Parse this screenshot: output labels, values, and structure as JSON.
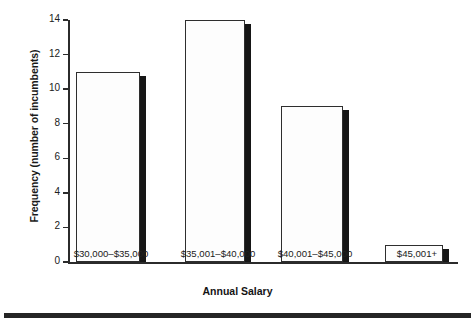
{
  "chart_data": {
    "type": "bar",
    "title": "",
    "subtitle": "",
    "xlabel": "Annual Salary",
    "ylabel": "Frequency (number of incumbents)",
    "categories": [
      "$30,000–$35,000",
      "$35,001–$40,000",
      "$40,001–$45,000",
      "$45,001+"
    ],
    "values": [
      11,
      14,
      9,
      1
    ],
    "series": [
      {
        "name": "Frequency",
        "values": [
          11,
          14,
          9,
          1
        ]
      }
    ],
    "ylim": [
      0,
      14
    ],
    "yticks": [
      0,
      2,
      4,
      6,
      8,
      10,
      12,
      14
    ],
    "ytick_labels": [
      "0",
      "2",
      "4",
      "6",
      "8",
      "10",
      "12",
      "14"
    ],
    "grid": false,
    "legend": false,
    "legend_position": "none",
    "bar_fill_color": "#fdfdfd",
    "bar_edge_color": "#2e2e2e",
    "bar_shadow_color": "#161616",
    "axis_color": "#2b2b2b",
    "background_color": "#ffffff",
    "annotations": []
  },
  "figure": {
    "bottom_rule_color": "#252525"
  }
}
